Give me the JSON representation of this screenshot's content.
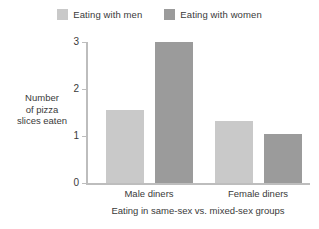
{
  "chart_data": {
    "type": "bar",
    "title": "",
    "subtitle": "",
    "xlabel": "Eating in same-sex vs. mixed-sex groups",
    "ylabel_lines": [
      "Number",
      "of pizza",
      "slices eaten"
    ],
    "ylabel": "Number of pizza slices eaten",
    "categories": [
      "Male diners",
      "Female diners"
    ],
    "series": [
      {
        "name": "Eating with men",
        "color": "#c9c9c9",
        "values": [
          1.55,
          1.33
        ]
      },
      {
        "name": "Eating with women",
        "color": "#9b9b9b",
        "values": [
          3.0,
          1.05
        ]
      }
    ],
    "ylim": [
      0,
      3
    ],
    "yticks": [
      0,
      1,
      2,
      3
    ],
    "ytick_labels": [
      "0",
      "1",
      "2",
      "3"
    ],
    "grid": false,
    "legend_position": "top-center",
    "axis_color": "#bdbdbd",
    "text_color": "#3a3a3a",
    "background": "#ffffff"
  },
  "legend": {
    "entries": [
      {
        "label": "Eating with men",
        "color": "#c9c9c9"
      },
      {
        "label": "Eating with women",
        "color": "#9b9b9b"
      }
    ]
  }
}
